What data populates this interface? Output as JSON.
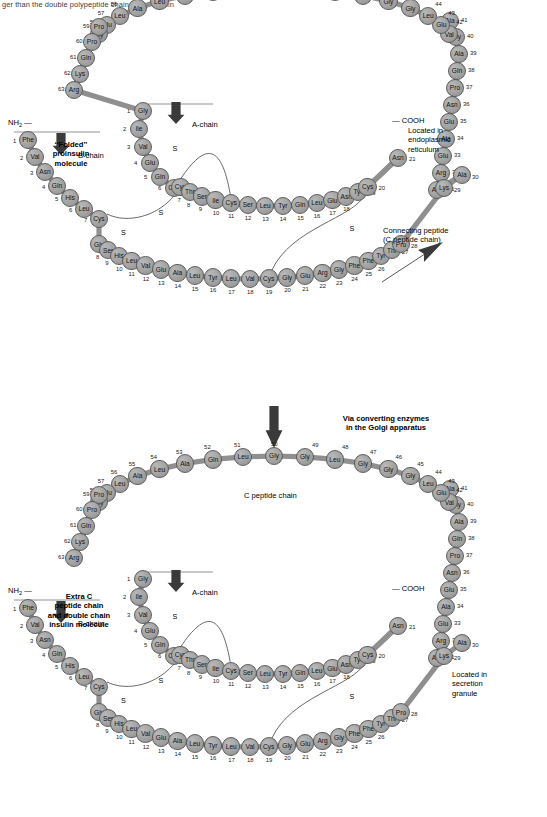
{
  "header_text": "ger than the double polypeptide chain of the insulin",
  "colors": {
    "residue_fill": "#a5a5a5",
    "residue_stroke": "#5d5d5d",
    "text": "#000000"
  },
  "labels": {
    "folded_proinsulin": "‘‘Folded’’\nproinsulin\nmolecule",
    "extra_c_peptide": "Extra C\npeptide chain\nand double chain\ninsulin molecule",
    "located_er": "Located in\nendoplasmic\nreticulum",
    "located_granule": "Located in\nsecretion\ngranule",
    "connecting_peptide": "Connecting peptide\n(C peptide chain)",
    "converting_enzymes": "Via converting enzymes\nin the Golgi apparatus",
    "c_peptide_chain": "C peptide chain",
    "a_chain": "A-chain",
    "b_chain": "B-chain",
    "nh2": "NH2 —",
    "cooh": "— COOH",
    "disulfide": "S"
  },
  "chains": {
    "a_chain": {
      "name": "A-chain",
      "residues": [
        {
          "n": 1,
          "aa": "Gly"
        },
        {
          "n": 2,
          "aa": "Ile"
        },
        {
          "n": 3,
          "aa": "Val"
        },
        {
          "n": 4,
          "aa": "Glu"
        },
        {
          "n": 5,
          "aa": "Gln"
        },
        {
          "n": 6,
          "aa": "Cys"
        },
        {
          "n": 7,
          "aa": "Cys"
        },
        {
          "n": 8,
          "aa": "Thr"
        },
        {
          "n": 9,
          "aa": "Ser"
        },
        {
          "n": 10,
          "aa": "Ile"
        },
        {
          "n": 11,
          "aa": "Cys"
        },
        {
          "n": 12,
          "aa": "Ser"
        },
        {
          "n": 13,
          "aa": "Leu"
        },
        {
          "n": 14,
          "aa": "Tyr"
        },
        {
          "n": 15,
          "aa": "Gln"
        },
        {
          "n": 16,
          "aa": "Leu"
        },
        {
          "n": 17,
          "aa": "Glu"
        },
        {
          "n": 18,
          "aa": "Asn"
        },
        {
          "n": 19,
          "aa": "Tyr"
        },
        {
          "n": 20,
          "aa": "Cys"
        },
        {
          "n": 21,
          "aa": "Asn"
        }
      ]
    },
    "b_chain": {
      "name": "B-chain",
      "residues": [
        {
          "n": 1,
          "aa": "Phe"
        },
        {
          "n": 2,
          "aa": "Val"
        },
        {
          "n": 3,
          "aa": "Asn"
        },
        {
          "n": 4,
          "aa": "Gln"
        },
        {
          "n": 5,
          "aa": "His"
        },
        {
          "n": 6,
          "aa": "Leu"
        },
        {
          "n": 7,
          "aa": "Cys"
        },
        {
          "n": 8,
          "aa": "Gly"
        },
        {
          "n": 9,
          "aa": "Ser"
        },
        {
          "n": 10,
          "aa": "His"
        },
        {
          "n": 11,
          "aa": "Leu"
        },
        {
          "n": 12,
          "aa": "Val"
        },
        {
          "n": 13,
          "aa": "Glu"
        },
        {
          "n": 14,
          "aa": "Ala"
        },
        {
          "n": 15,
          "aa": "Leu"
        },
        {
          "n": 16,
          "aa": "Tyr"
        },
        {
          "n": 17,
          "aa": "Leu"
        },
        {
          "n": 18,
          "aa": "Val"
        },
        {
          "n": 19,
          "aa": "Cys"
        },
        {
          "n": 20,
          "aa": "Gly"
        },
        {
          "n": 21,
          "aa": "Glu"
        },
        {
          "n": 22,
          "aa": "Arg"
        },
        {
          "n": 23,
          "aa": "Gly"
        },
        {
          "n": 24,
          "aa": "Phe"
        },
        {
          "n": 25,
          "aa": "Phe"
        },
        {
          "n": 26,
          "aa": "Tyr"
        },
        {
          "n": 27,
          "aa": "Thr"
        },
        {
          "n": 28,
          "aa": "Pro"
        },
        {
          "n": 29,
          "aa": "Lys"
        },
        {
          "n": 30,
          "aa": "Ala"
        }
      ]
    },
    "c_peptide": {
      "name": "C peptide chain",
      "residues": [
        {
          "n": 31,
          "aa": "Arg"
        },
        {
          "n": 32,
          "aa": "Arg"
        },
        {
          "n": 33,
          "aa": "Glu"
        },
        {
          "n": 34,
          "aa": "Ala"
        },
        {
          "n": 35,
          "aa": "Glu"
        },
        {
          "n": 36,
          "aa": "Asn"
        },
        {
          "n": 37,
          "aa": "Pro"
        },
        {
          "n": 38,
          "aa": "Gln"
        },
        {
          "n": 39,
          "aa": "Ala"
        },
        {
          "n": 40,
          "aa": "Gly"
        },
        {
          "n": 41,
          "aa": "Ala"
        },
        {
          "n": 42,
          "aa": "Val"
        },
        {
          "n": 43,
          "aa": "Glu"
        },
        {
          "n": 44,
          "aa": "Leu"
        },
        {
          "n": 45,
          "aa": "Gly"
        },
        {
          "n": 46,
          "aa": "Gly"
        },
        {
          "n": 47,
          "aa": "Gly"
        },
        {
          "n": 48,
          "aa": "Leu"
        },
        {
          "n": 49,
          "aa": "Gly"
        },
        {
          "n": 50,
          "aa": "Gly"
        },
        {
          "n": 51,
          "aa": "Leu"
        },
        {
          "n": 52,
          "aa": "Gln"
        },
        {
          "n": 53,
          "aa": "Ala"
        },
        {
          "n": 54,
          "aa": "Leu"
        },
        {
          "n": 55,
          "aa": "Ala"
        },
        {
          "n": 56,
          "aa": "Leu"
        },
        {
          "n": 57,
          "aa": "Glu"
        },
        {
          "n": 58,
          "aa": "Gly"
        },
        {
          "n": 59,
          "aa": "Pro"
        },
        {
          "n": 60,
          "aa": "Pro"
        },
        {
          "n": 61,
          "aa": "Gln"
        },
        {
          "n": 62,
          "aa": "Lys"
        },
        {
          "n": 63,
          "aa": "Arg"
        }
      ]
    }
  },
  "disulfide_bonds": [
    {
      "from": "A6",
      "to": "A11",
      "type": "intrachain"
    },
    {
      "from": "A7",
      "to": "B7",
      "type": "interchain"
    },
    {
      "from": "A20",
      "to": "B19",
      "type": "interchain"
    }
  ],
  "panels": [
    {
      "id": "proinsulin",
      "title": "‘‘Folded’’ proinsulin molecule",
      "location": "Located in endoplasmic reticulum",
      "connected": true
    },
    {
      "id": "insulin",
      "title": "Extra C peptide chain and double chain insulin molecule",
      "location": "Located in secretion granule",
      "connected": false
    }
  ]
}
